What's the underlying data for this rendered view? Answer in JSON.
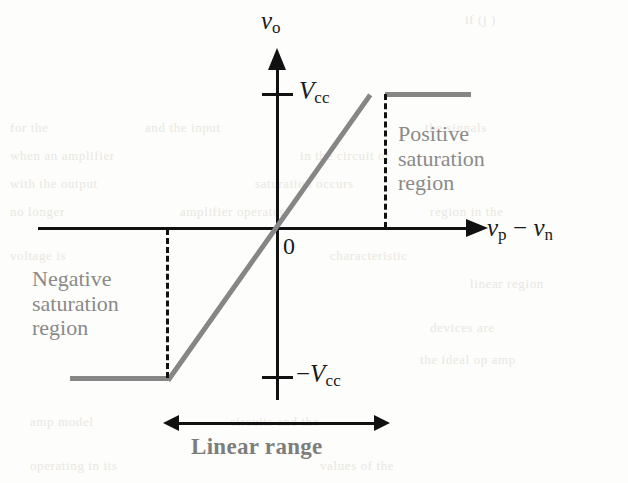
{
  "figure": {
    "background_color": "#fdfdfb",
    "curve_color": "#868686",
    "axis_color": "#111111",
    "region_label_color": "#8a8a8a"
  },
  "axes": {
    "y_axis_label_plain": "vo",
    "y_axis_var": "v",
    "y_axis_sub": "o",
    "x_axis_label_plain": "vp − vn",
    "x_axis_var1": "v",
    "x_axis_sub1": "p",
    "x_axis_minus": " − ",
    "x_axis_var2": "v",
    "x_axis_sub2": "n",
    "origin_label": "0"
  },
  "ticks": {
    "positive_var": "V",
    "positive_sub": "cc",
    "positive_label_plain": "Vcc",
    "negative_prefix": "−",
    "negative_var": "V",
    "negative_sub": "cc",
    "negative_label_plain": "−Vcc"
  },
  "annotations": {
    "positive_region": "Positive\nsaturation\nregion",
    "negative_region": "Negative\nsaturation\nregion",
    "linear_range": "Linear range"
  },
  "chart_data": {
    "type": "line",
    "xlabel": "vp − vn",
    "ylabel": "vo",
    "x": [
      -2.4,
      -1.0,
      1.0,
      2.2
    ],
    "y": [
      -1,
      -1,
      1,
      1
    ],
    "y_tick_labels": [
      "Vcc",
      "0",
      "−Vcc"
    ],
    "y_tick_values": [
      1,
      0,
      -1
    ],
    "x_tick_labels": [
      "0"
    ],
    "x_tick_values": [
      0
    ],
    "grid": false,
    "legend": null,
    "series": [
      {
        "name": "vo vs (vp - vn)",
        "points": [
          {
            "x": -2.4,
            "y": -1
          },
          {
            "x": -1.0,
            "y": -1
          },
          {
            "x": 1.0,
            "y": 1
          },
          {
            "x": 2.2,
            "y": 1
          }
        ]
      }
    ],
    "annotations": [
      {
        "text": "Positive saturation region",
        "x": 1.3,
        "y": 0.55
      },
      {
        "text": "Negative saturation region",
        "x": -2.2,
        "y": -0.3
      },
      {
        "text": "Linear range",
        "x": 0.0,
        "y": -1.45
      },
      {
        "text": "0",
        "x": 0.06,
        "y": -0.08
      }
    ],
    "xlim": [
      -2.6,
      2.4
    ],
    "ylim": [
      -1.4,
      1.3
    ]
  },
  "ghost_lines": [
    {
      "text": "if  (j  )",
      "left": 465,
      "top": 12
    },
    {
      "text": "for the",
      "left": 10,
      "top": 120
    },
    {
      "text": "and  the  input",
      "left": 145,
      "top": 120
    },
    {
      "text": "the  signals",
      "left": 425,
      "top": 120
    },
    {
      "text": "when  an  amplifier",
      "left": 10,
      "top": 148
    },
    {
      "text": "in  the  circuit  of",
      "left": 300,
      "top": 148
    },
    {
      "text": "with  the  output",
      "left": 10,
      "top": 176
    },
    {
      "text": "saturation  occurs",
      "left": 255,
      "top": 176
    },
    {
      "text": "no  longer",
      "left": 10,
      "top": 204
    },
    {
      "text": "amplifier  operates",
      "left": 180,
      "top": 204
    },
    {
      "text": "region  in  the",
      "left": 430,
      "top": 204
    },
    {
      "text": "voltage  is",
      "left": 10,
      "top": 248
    },
    {
      "text": "characteristic",
      "left": 330,
      "top": 248
    },
    {
      "text": "linear  region",
      "left": 470,
      "top": 276
    },
    {
      "text": "devices  are",
      "left": 430,
      "top": 320
    },
    {
      "text": "the  ideal  op  amp",
      "left": 420,
      "top": 352
    },
    {
      "text": "amp  model",
      "left": 30,
      "top": 414
    },
    {
      "text": "circuits  and  the",
      "left": 230,
      "top": 414
    },
    {
      "text": "operating  in  its",
      "left": 30,
      "top": 458
    },
    {
      "text": "values  of  the",
      "left": 320,
      "top": 458
    }
  ]
}
